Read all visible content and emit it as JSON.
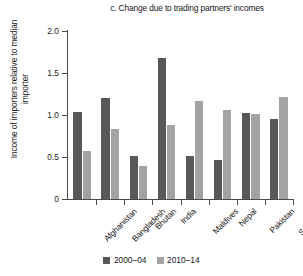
{
  "chart_data": {
    "type": "bar",
    "title": "c. Change due to trading partners' incomes",
    "xlabel": "",
    "ylabel": "Income of importers relative to median importer",
    "ylim": [
      0,
      2.0
    ],
    "ytick_labels": [
      "0",
      "0.5",
      "1.0",
      "1.5",
      "2.0"
    ],
    "ytick_values": [
      0,
      0.5,
      1.0,
      1.5,
      2.0
    ],
    "grid": false,
    "legend_position": "bottom-center",
    "categories": [
      "Afghanistan",
      "Bangladesh",
      "Bhutan",
      "India",
      "Maldives",
      "Nepal",
      "Pakistan",
      "Sri Lanka"
    ],
    "series": [
      {
        "name": "2000–04",
        "color": "#585858",
        "values": [
          1.03,
          1.2,
          0.51,
          1.68,
          0.51,
          0.46,
          1.02,
          0.95
        ]
      },
      {
        "name": "2010–14",
        "color": "#a3a3a3",
        "values": [
          0.57,
          0.83,
          0.39,
          0.88,
          1.17,
          1.06,
          1.01,
          1.21
        ]
      }
    ]
  },
  "legend": {
    "items": [
      {
        "label": "2000–04",
        "series": 0
      },
      {
        "label": "2010–14",
        "series": 1
      }
    ]
  }
}
